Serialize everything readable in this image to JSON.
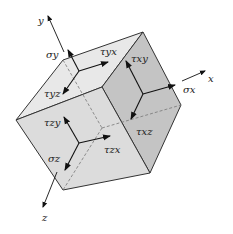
{
  "diagram": {
    "colors": {
      "background": "#ffffff",
      "top_face": "#e8e8e8",
      "front_face": "#dcdcdc",
      "right_face": "#c4c4c4",
      "edge": "#333333",
      "hidden_edge": "#777777",
      "arrow": "#111111"
    },
    "axes": {
      "x": "x",
      "y": "y",
      "z": "z"
    },
    "labels": {
      "sigma_y": "σy",
      "tau_yx": "τyx",
      "tau_yz": "τyz",
      "tau_xy": "τxy",
      "sigma_x": "σx",
      "tau_xz": "τxz",
      "tau_zy": "τzy",
      "tau_zx": "τzx",
      "sigma_z": "σz"
    }
  }
}
